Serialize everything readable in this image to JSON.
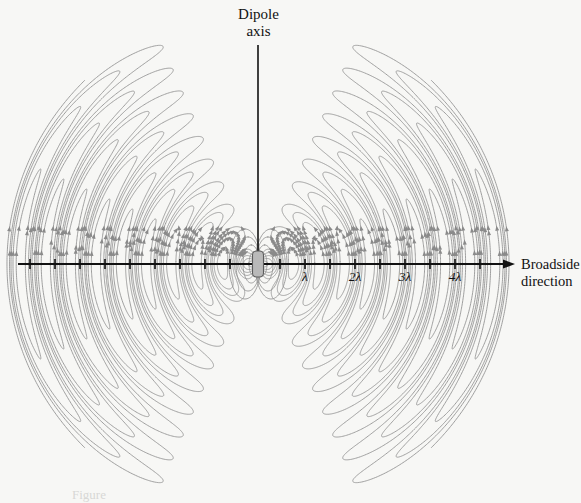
{
  "figure": {
    "type": "dipole-radiation-field-lines",
    "background_color": "#f7f7f5",
    "field_line_color": "#8f8f8f",
    "axis_color": "#111111",
    "dipole_color": "#b9b9b9",
    "caption": "Figure"
  },
  "labels": {
    "dipole_axis_line1": "Dipole",
    "dipole_axis_line2": "axis",
    "broadside_line1": "Broadside",
    "broadside_line2": "direction"
  },
  "axes": {
    "horizontal": {
      "name": "broadside-axis",
      "y": 264,
      "x_start": 18,
      "x_end": 515,
      "arrow": "right",
      "tick_spacing_px": 25,
      "tick_half_length": 5,
      "center_x": 258
    },
    "vertical": {
      "name": "dipole-axis",
      "x": 258,
      "y_top": 45,
      "y_bottom": 264
    }
  },
  "dipole": {
    "center_x": 258,
    "center_y": 264,
    "width": 11,
    "height": 26,
    "radius": 4
  },
  "chart_data": {
    "type": "line",
    "xlabel": "Broadside direction",
    "ylabel": "Dipole axis",
    "grid": false,
    "legend": null,
    "x_tick_labels": [
      "λ",
      "2λ",
      "3λ",
      "4λ"
    ],
    "x_tick_values": [
      1,
      2,
      3,
      4
    ],
    "x_tick_pixels": [
      305,
      355,
      405,
      455
    ],
    "unlabeled_tick_pixels_right": [
      280,
      330,
      380,
      430,
      480
    ],
    "unlabeled_tick_pixels_left": [
      30,
      55,
      80,
      105,
      130,
      155,
      180,
      205,
      230
    ],
    "x_range_wavelengths": [
      -4.8,
      5.1
    ],
    "pixels_per_wavelength": 50,
    "lobe_count_per_side": 14,
    "arrowheads_on_field_lines": true,
    "symmetry": "mirror about vertical dipole axis and about horizontal broadside axis"
  }
}
